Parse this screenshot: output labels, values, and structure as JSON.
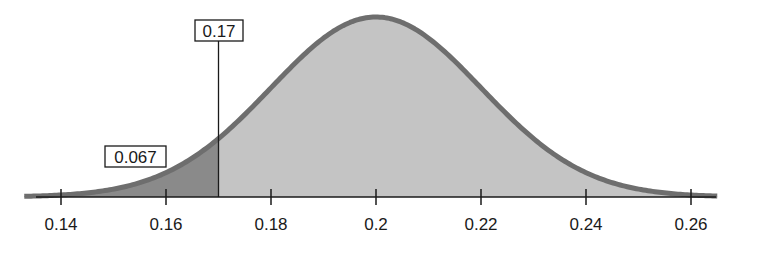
{
  "chart_data": {
    "type": "area",
    "title": "",
    "xlabel": "",
    "ylabel": "",
    "distribution": "normal",
    "mean": 0.2,
    "std_dev": 0.02,
    "xlim": [
      0.133,
      0.265
    ],
    "x_ticks": [
      0.14,
      0.16,
      0.18,
      0.2,
      0.22,
      0.24,
      0.26
    ],
    "x_tick_labels": [
      "0.14",
      "0.16",
      "0.18",
      "0.2",
      "0.22",
      "0.24",
      "0.26"
    ],
    "grid": false,
    "legend": null,
    "annotations": [
      {
        "type": "cutoff-line",
        "x": 0.17,
        "label": "0.17"
      },
      {
        "type": "shaded-tail-area",
        "region": "left of 0.17",
        "value": 0.067,
        "label": "0.067"
      }
    ],
    "colors": {
      "curve": "#6e6e6e",
      "body_fill": "#c4c4c4",
      "tail_fill": "#8a8a8a",
      "axis": "#1a1a1a"
    }
  },
  "labels": {
    "cutoff": "0.17",
    "tail_area": "0.067"
  }
}
